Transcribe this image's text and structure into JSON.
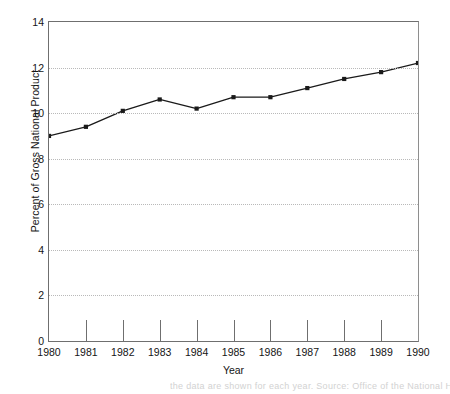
{
  "chart_data": {
    "type": "line",
    "title": "",
    "xlabel": "Year",
    "ylabel": "Percent of Gross National Product",
    "categories": [
      "1980",
      "1981",
      "1982",
      "1983",
      "1984",
      "1985",
      "1986",
      "1987",
      "1988",
      "1989",
      "1990"
    ],
    "x": [
      1980,
      1981,
      1982,
      1983,
      1984,
      1985,
      1986,
      1987,
      1988,
      1989,
      1990
    ],
    "values": [
      9.0,
      9.4,
      10.1,
      10.6,
      10.2,
      10.7,
      10.7,
      11.1,
      11.5,
      11.8,
      12.2
    ],
    "series": [
      {
        "name": "Percent of Gross National Product",
        "values": [
          9.0,
          9.4,
          10.1,
          10.6,
          10.2,
          10.7,
          10.7,
          11.1,
          11.5,
          11.8,
          12.2
        ]
      }
    ],
    "ylim": [
      0,
      14
    ],
    "xlim": [
      1980,
      1990
    ],
    "yticks": [
      0,
      2,
      4,
      6,
      8,
      10,
      12,
      14
    ],
    "ytick_labels": [
      "0",
      "2",
      "4",
      "6",
      "8",
      "10",
      "12",
      "14"
    ],
    "xticks": [
      1980,
      1981,
      1982,
      1983,
      1984,
      1985,
      1986,
      1987,
      1988,
      1989,
      1990
    ],
    "grid": "horizontal-dotted",
    "legend": "none",
    "marker": "filled-square",
    "line_color": "#1a1a1a",
    "marker_color": "#1a1a1a",
    "grid_color": "#b9b9b9",
    "axis_color": "#6f6f6f",
    "background_color": "#ffffff"
  },
  "artifact": {
    "text": "the data are shown for each year. Source: Office of the National Health Care"
  }
}
